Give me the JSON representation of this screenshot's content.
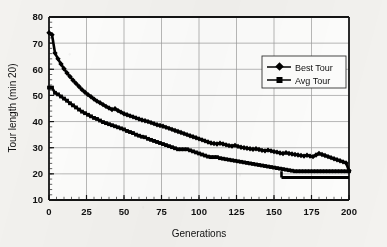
{
  "chart_data": {
    "type": "line",
    "title": "",
    "xlabel": "Generations",
    "ylabel": "Tour length (min 20)",
    "xlim": [
      0,
      200
    ],
    "ylim": [
      10,
      80
    ],
    "xticks": [
      0,
      25,
      50,
      75,
      100,
      125,
      150,
      175,
      200
    ],
    "yticks": [
      10,
      20,
      30,
      40,
      50,
      60,
      70,
      80
    ],
    "grid": true,
    "legend_position": "inside-top-right",
    "legend": [
      "Best Tour",
      "Avg Tour"
    ],
    "series": [
      {
        "name": "Avg Tour",
        "marker": "filled-diamond",
        "color": "#000000",
        "x": [
          0,
          2,
          4,
          6,
          8,
          10,
          12,
          14,
          16,
          18,
          20,
          22,
          24,
          26,
          28,
          30,
          32,
          34,
          36,
          38,
          40,
          42,
          44,
          46,
          48,
          50,
          52,
          54,
          56,
          58,
          60,
          62,
          64,
          66,
          68,
          70,
          72,
          74,
          76,
          78,
          80,
          82,
          84,
          86,
          88,
          90,
          92,
          94,
          96,
          98,
          100,
          102,
          104,
          106,
          108,
          110,
          112,
          114,
          116,
          118,
          120,
          122,
          124,
          126,
          128,
          130,
          132,
          134,
          136,
          138,
          140,
          142,
          144,
          146,
          148,
          150,
          152,
          154,
          156,
          158,
          160,
          162,
          164,
          166,
          168,
          170,
          172,
          174,
          176,
          178,
          180,
          182,
          184,
          186,
          188,
          190,
          192,
          194,
          196,
          198,
          200
        ],
        "y": [
          74.0,
          73.2,
          66.2,
          64.0,
          62.0,
          60.2,
          58.6,
          57.2,
          55.8,
          54.6,
          53.4,
          52.2,
          51.2,
          50.3,
          49.5,
          48.6,
          47.8,
          47.2,
          46.5,
          45.8,
          45.2,
          44.6,
          44.9,
          44.2,
          43.6,
          43.0,
          42.6,
          42.2,
          41.8,
          41.4,
          41.0,
          40.6,
          40.3,
          40.0,
          39.6,
          39.2,
          38.8,
          38.5,
          38.2,
          37.8,
          37.4,
          37.0,
          36.6,
          36.2,
          35.8,
          35.4,
          35.0,
          34.6,
          34.2,
          33.8,
          33.4,
          33.0,
          32.6,
          32.2,
          31.8,
          31.6,
          31.4,
          31.7,
          31.4,
          31.1,
          30.8,
          30.6,
          30.9,
          30.5,
          30.2,
          30.0,
          29.8,
          29.6,
          29.4,
          29.6,
          29.3,
          29.0,
          28.8,
          29.1,
          28.8,
          28.5,
          28.3,
          28.0,
          27.8,
          28.1,
          27.8,
          27.6,
          27.4,
          27.2,
          27.0,
          26.8,
          27.1,
          26.8,
          26.6,
          27.2,
          27.8,
          27.4,
          27.0,
          26.6,
          26.2,
          25.8,
          25.4,
          25.0,
          24.6,
          24.2,
          21.2
        ]
      },
      {
        "name": "Best Tour",
        "marker": "filled-square",
        "color": "#000000",
        "x": [
          0,
          2,
          4,
          6,
          8,
          10,
          12,
          14,
          16,
          18,
          20,
          22,
          24,
          26,
          28,
          30,
          32,
          34,
          36,
          38,
          40,
          42,
          44,
          46,
          48,
          50,
          52,
          54,
          56,
          58,
          60,
          62,
          64,
          66,
          68,
          70,
          72,
          74,
          76,
          78,
          80,
          82,
          84,
          86,
          88,
          90,
          92,
          94,
          96,
          98,
          100,
          102,
          104,
          106,
          108,
          110,
          112,
          114,
          116,
          118,
          120,
          122,
          124,
          126,
          128,
          130,
          132,
          134,
          136,
          138,
          140,
          142,
          144,
          146,
          148,
          150,
          152,
          154,
          156,
          158,
          160,
          162,
          164,
          166,
          168,
          170,
          172,
          174,
          176,
          178,
          180,
          182,
          184,
          186,
          188,
          190,
          192,
          194,
          196,
          198,
          200
        ],
        "y": [
          53.0,
          53.0,
          51.0,
          50.4,
          49.6,
          48.8,
          48.0,
          47.0,
          46.2,
          45.4,
          44.6,
          43.8,
          43.2,
          42.6,
          42.0,
          41.4,
          41.0,
          40.4,
          39.8,
          39.4,
          39.0,
          38.6,
          38.2,
          37.8,
          37.4,
          37.0,
          36.4,
          36.0,
          35.6,
          35.0,
          34.6,
          34.2,
          34.0,
          33.4,
          33.0,
          32.6,
          32.2,
          31.8,
          31.4,
          31.0,
          30.6,
          30.2,
          29.8,
          29.4,
          29.4,
          29.4,
          29.4,
          29.0,
          28.6,
          28.2,
          27.8,
          27.4,
          27.0,
          26.6,
          26.4,
          26.4,
          26.4,
          26.0,
          25.8,
          25.6,
          25.4,
          25.2,
          25.0,
          24.8,
          24.6,
          24.4,
          24.2,
          24.0,
          23.8,
          23.6,
          23.4,
          23.2,
          23.0,
          22.8,
          22.6,
          22.4,
          22.2,
          22.0,
          21.8,
          21.6,
          21.4,
          21.2,
          21.0,
          21.0,
          21.0,
          21.0,
          21.0,
          21.0,
          21.0,
          21.0,
          21.0,
          21.0,
          21.0,
          21.0,
          21.0,
          21.0,
          21.0,
          21.0,
          21.0,
          21.0,
          21.0
        ]
      }
    ],
    "annotations": {
      "best_tour_step_generation": 155,
      "best_tour_final_value": 18.6,
      "avg_tour_final_value": 21.2
    }
  }
}
